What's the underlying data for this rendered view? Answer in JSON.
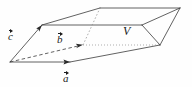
{
  "figure": {
    "kind": "parallelepiped-volume-diagram",
    "background_color": "#fefefe",
    "stroke_color": "#2a2a2a",
    "labels": {
      "vector_a": "a",
      "vector_b": "b",
      "vector_c": "c",
      "volume": "V"
    },
    "geometry": {
      "width": 192,
      "height": 87,
      "vertices": {
        "origin": [
          10,
          62
        ],
        "a_tip": [
          70,
          62
        ],
        "b_tip": [
          82,
          45
        ],
        "c_tip": [
          42,
          25
        ],
        "bottom_right": [
          160,
          45
        ],
        "top_back_left": [
          100,
          8
        ],
        "top_back_right": [
          180,
          8
        ],
        "top_front_right": [
          142,
          25
        ]
      },
      "solid_edges": [
        [
          [
            10,
            62
          ],
          [
            70,
            62
          ]
        ],
        [
          [
            70,
            62
          ],
          [
            160,
            45
          ]
        ],
        [
          [
            10,
            62
          ],
          [
            42,
            25
          ]
        ],
        [
          [
            42,
            25
          ],
          [
            100,
            8
          ]
        ],
        [
          [
            100,
            8
          ],
          [
            180,
            8
          ]
        ],
        [
          [
            180,
            8
          ],
          [
            142,
            25
          ]
        ],
        [
          [
            42,
            25
          ],
          [
            142,
            25
          ]
        ],
        [
          [
            160,
            45
          ],
          [
            180,
            8
          ]
        ],
        [
          [
            142,
            25
          ],
          [
            160,
            45
          ]
        ]
      ],
      "dashed_edges": [
        [
          [
            10,
            62
          ],
          [
            82,
            45
          ]
        ]
      ],
      "dotted_edges": [
        [
          [
            82,
            45
          ],
          [
            160,
            45
          ]
        ],
        [
          [
            82,
            45
          ],
          [
            100,
            8
          ]
        ]
      ],
      "arrow_vectors": [
        {
          "name": "a",
          "from": [
            10,
            62
          ],
          "to": [
            70,
            62
          ],
          "style": "solid"
        },
        {
          "name": "b",
          "from": [
            10,
            62
          ],
          "to": [
            82,
            45
          ],
          "style": "dashed"
        },
        {
          "name": "c",
          "from": [
            10,
            62
          ],
          "to": [
            42,
            25
          ],
          "style": "solid"
        }
      ]
    }
  }
}
